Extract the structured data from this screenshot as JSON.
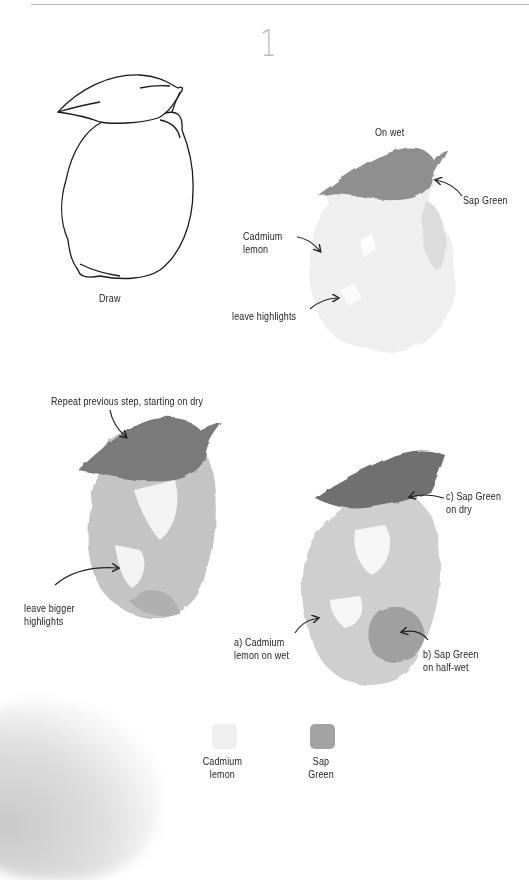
{
  "page": {
    "step_number": "1"
  },
  "panels": {
    "draw": {
      "caption": "Draw"
    },
    "on_wet": {
      "title": "On wet",
      "annotations": [
        {
          "id": "sap_green",
          "text": "Sap Green"
        },
        {
          "id": "cadmium_lemon",
          "text": "Cadmium\nlemon",
          "lines": [
            "Cadmium",
            "lemon"
          ]
        },
        {
          "id": "leave_highlights",
          "text": "leave highlights"
        }
      ]
    },
    "repeat": {
      "title": "Repeat previous step, starting on dry",
      "annotations": [
        {
          "id": "leave_bigger_highlights",
          "lines": [
            "leave bigger",
            "highlights"
          ]
        }
      ]
    },
    "final": {
      "annotations": [
        {
          "id": "c_sap_green_dry",
          "lines": [
            "c) Sap Green",
            "on dry"
          ]
        },
        {
          "id": "a_cadmium_wet",
          "lines": [
            "a) Cadmium",
            "lemon on wet"
          ]
        },
        {
          "id": "b_sap_green_halfwet",
          "lines": [
            "b) Sap Green",
            "on half-wet"
          ]
        }
      ]
    }
  },
  "legend": {
    "swatches": [
      {
        "name_lines": [
          "Cadmium",
          "lemon"
        ],
        "color": "#efefef"
      },
      {
        "name_lines": [
          "Sap",
          "Green"
        ],
        "color": "#a3a3a3"
      }
    ]
  },
  "colors": {
    "rule": "#b5b5b5",
    "step_number": "#bdbdbd",
    "ink": "#222222",
    "lemon_wash": "#eeeeee",
    "sap_green_wash": "#8e8e8e"
  }
}
